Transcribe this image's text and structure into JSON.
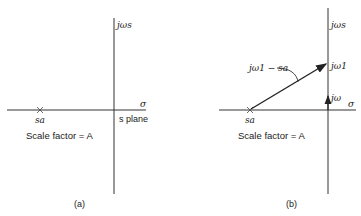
{
  "panel_a": {
    "caption": "(a)",
    "vertical_axis_label": "jωs",
    "horizontal_axis_label": "σ",
    "plane_label": "s plane",
    "pole_label": "sa",
    "scale_factor_label": "Scale factor = A"
  },
  "panel_b": {
    "caption": "(b)",
    "vertical_axis_label": "jωs",
    "horizontal_axis_label": "σ",
    "pole_label": "sa",
    "vector_label": "jω1 − sa",
    "point_label": "jω1",
    "jw_arrow_label": "jω",
    "scale_factor_label": "Scale factor = A"
  },
  "colors": {
    "ink": "#222222",
    "background": "#ffffff"
  }
}
